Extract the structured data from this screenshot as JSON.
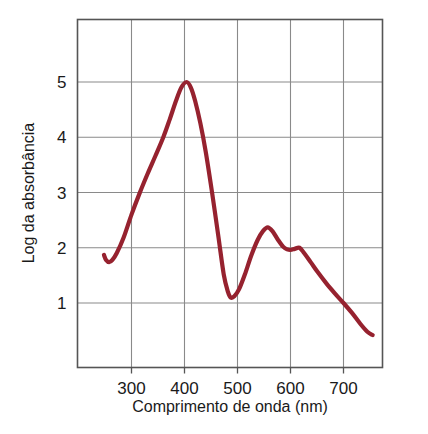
{
  "chart_data": {
    "type": "line",
    "title": "",
    "subtitle": "",
    "xlabel": "Comprimento de onda (nm)",
    "ylabel": "Log da absorbância",
    "xlim": [
      240,
      765
    ],
    "ylim": [
      0,
      5.8
    ],
    "xticks": [
      300,
      400,
      500,
      600,
      700
    ],
    "xtick_labels": [
      "300",
      "400",
      "500",
      "600",
      "700"
    ],
    "yticks": [
      1,
      2,
      3,
      4,
      5
    ],
    "ytick_labels": [
      "1",
      "2",
      "3",
      "4",
      "5"
    ],
    "grid": true,
    "legend": null,
    "legend_position": "none",
    "annotations": [],
    "series": [
      {
        "name": "Espectro de absorção",
        "color": "#96222F",
        "line_width": 4.2,
        "x": [
          248,
          252,
          258,
          264,
          272,
          285,
          300,
          315,
          330,
          345,
          360,
          372,
          384,
          394,
          404,
          412,
          420,
          430,
          440,
          452,
          464,
          474,
          482,
          487,
          494,
          503,
          514,
          526,
          538,
          548,
          557,
          566,
          576,
          586,
          594,
          600,
          608,
          617,
          626,
          638,
          652,
          668,
          684,
          700,
          716,
          732,
          745,
          755
        ],
        "y": [
          1.87,
          1.78,
          1.74,
          1.78,
          1.9,
          2.18,
          2.6,
          2.98,
          3.33,
          3.66,
          4.0,
          4.32,
          4.66,
          4.9,
          5.0,
          4.9,
          4.66,
          4.25,
          3.74,
          3.0,
          2.2,
          1.52,
          1.2,
          1.1,
          1.12,
          1.25,
          1.52,
          1.86,
          2.14,
          2.3,
          2.37,
          2.3,
          2.15,
          2.02,
          1.97,
          1.96,
          1.98,
          2.0,
          1.9,
          1.74,
          1.55,
          1.35,
          1.17,
          1.0,
          0.82,
          0.62,
          0.48,
          0.42
        ]
      }
    ],
    "features": {
      "primary_peak": {
        "x": 404,
        "y": 5.0
      },
      "primary_valley": {
        "x": 487,
        "y": 1.1
      },
      "secondary_peak": {
        "x": 557,
        "y": 2.37
      },
      "secondary_shoulder": {
        "x": 617,
        "y": 2.0
      },
      "start_point": {
        "x": 248,
        "y": 1.87
      },
      "end_point": {
        "x": 755,
        "y": 0.42
      }
    }
  },
  "colors": {
    "series": "#96222F",
    "grid": "#8a8a8a",
    "frame": "#555555",
    "text": "#1a1a1a",
    "background": "#ffffff"
  }
}
